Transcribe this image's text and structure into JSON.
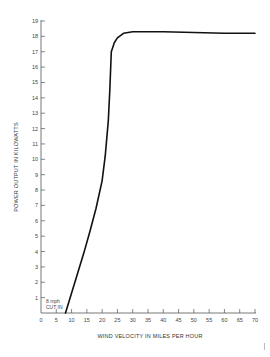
{
  "chart_data": {
    "type": "line",
    "title": "",
    "xlabel": "WIND VELOCITY IN MILES PER HOUR",
    "ylabel": "POWER OUTPUT IN KILOWATTS",
    "xlim": [
      0,
      70
    ],
    "ylim": [
      0,
      19
    ],
    "x_ticks": [
      0,
      5,
      10,
      15,
      20,
      25,
      30,
      35,
      40,
      45,
      50,
      55,
      60,
      65,
      70
    ],
    "y_ticks": [
      1,
      2,
      3,
      4,
      5,
      6,
      7,
      8,
      9,
      10,
      11,
      12,
      13,
      14,
      15,
      16,
      17,
      18,
      19
    ],
    "grid": false,
    "legend": null,
    "annotations": [
      {
        "text_line1": "8 mph",
        "text_line2": "CUT IN",
        "x": 8,
        "y": 0
      }
    ],
    "series": [
      {
        "name": "Power output",
        "x": [
          8,
          10,
          12,
          14,
          16,
          18,
          20,
          21,
          22,
          22.5,
          23,
          24,
          25,
          27,
          30,
          35,
          40,
          50,
          60,
          70
        ],
        "y": [
          0,
          1.3,
          2.6,
          3.9,
          5.3,
          6.8,
          8.6,
          10.2,
          12.5,
          14.5,
          17.0,
          17.6,
          17.9,
          18.2,
          18.3,
          18.3,
          18.3,
          18.25,
          18.2,
          18.2
        ]
      }
    ]
  },
  "labels": {
    "cut_in_line1": "8 mph",
    "cut_in_line2": "CUT IN",
    "xlabel": "WIND VELOCITY IN MILES PER HOUR",
    "ylabel": "POWER OUTPUT IN KILOWATTS"
  }
}
